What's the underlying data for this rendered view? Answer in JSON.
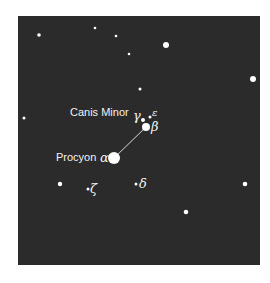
{
  "figure": {
    "background_color": "#2b2b2b",
    "star_color": "#ffffff",
    "constellation_name": "Canis Minor",
    "bright_star_name": "Procyon"
  },
  "stars": [
    {
      "id": "alpha",
      "label": "α",
      "x": 114,
      "y": 158,
      "r": 6
    },
    {
      "id": "beta",
      "label": "β",
      "x": 146,
      "y": 127,
      "r": 4
    },
    {
      "id": "gamma",
      "label": "γ",
      "x": 143,
      "y": 120,
      "r": 2
    },
    {
      "id": "epsilon",
      "label": "ε",
      "x": 150,
      "y": 117,
      "r": 1.5
    },
    {
      "id": "delta",
      "label": "δ",
      "x": 136,
      "y": 184,
      "r": 1.5
    },
    {
      "id": "zeta",
      "label": "ζ",
      "x": 88,
      "y": 189,
      "r": 1.5
    },
    {
      "id": "bg1",
      "label": "",
      "x": 39,
      "y": 35,
      "r": 1.8
    },
    {
      "id": "bg2",
      "label": "",
      "x": 95,
      "y": 28,
      "r": 1.3
    },
    {
      "id": "bg3",
      "label": "",
      "x": 116,
      "y": 36,
      "r": 1.3
    },
    {
      "id": "bg4",
      "label": "",
      "x": 129,
      "y": 54,
      "r": 1.3
    },
    {
      "id": "bg5",
      "label": "",
      "x": 166,
      "y": 45,
      "r": 3
    },
    {
      "id": "bg6",
      "label": "",
      "x": 140,
      "y": 89,
      "r": 1.5
    },
    {
      "id": "bg7",
      "label": "",
      "x": 253,
      "y": 79,
      "r": 3
    },
    {
      "id": "bg8",
      "label": "",
      "x": 24,
      "y": 118,
      "r": 1.5
    },
    {
      "id": "bg9",
      "label": "",
      "x": 60,
      "y": 184,
      "r": 2.2
    },
    {
      "id": "bg10",
      "label": "",
      "x": 245,
      "y": 184,
      "r": 2.3
    },
    {
      "id": "bg11",
      "label": "",
      "x": 186,
      "y": 212,
      "r": 2.3
    }
  ],
  "lines": [
    {
      "from": "alpha",
      "to": "beta"
    }
  ],
  "labels": {
    "constellation": "Canis Minor",
    "procyon": "Procyon",
    "alpha": "α",
    "beta": "β",
    "gamma": "γ",
    "epsilon": "ε",
    "delta": "δ",
    "zeta": "ζ"
  }
}
